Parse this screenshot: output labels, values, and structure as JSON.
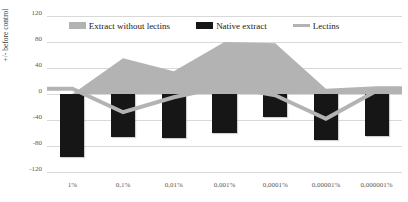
{
  "chart_data": {
    "type": "bar",
    "title": "",
    "xlabel": "",
    "ylabel": "+/- before control",
    "categories": [
      "1%",
      "0,1%",
      "0,01%",
      "0,001%",
      "0,0001%",
      "0,00001%",
      "0,000001%"
    ],
    "ylim": [
      -120,
      120
    ],
    "yticks": [
      120,
      80,
      40,
      0,
      -40,
      -80,
      -120
    ],
    "grid": true,
    "legend_position": "top",
    "series": [
      {
        "name": "Extract without lectins",
        "type": "area",
        "color": "#b3b3b3",
        "values": [
          0,
          55,
          35,
          80,
          78,
          8,
          12
        ]
      },
      {
        "name": "Native extract",
        "type": "bar",
        "color": "#161616",
        "values": [
          -97,
          -66,
          -68,
          -60,
          -35,
          -71,
          -65
        ]
      },
      {
        "name": "Lectins",
        "type": "line",
        "color": "#b3b3b3",
        "values": [
          8,
          -28,
          -5,
          12,
          -2,
          -38,
          5
        ]
      }
    ]
  },
  "axis": {
    "y_title": "+/- before control",
    "y_labels": [
      "120",
      "80",
      "40",
      "0",
      "-40",
      "-80",
      "-120"
    ],
    "x_labels": [
      "1%",
      "0,1%",
      "0,01%",
      "0,001%",
      "0,0001%",
      "0,00001%",
      "0,000001%"
    ]
  },
  "legend": {
    "items": [
      {
        "label": "Extract without lectins",
        "color": "#b3b3b3",
        "marker": "area-swatch"
      },
      {
        "label": "Native extract",
        "color": "#161616",
        "marker": "bar-swatch"
      },
      {
        "label": "Lectins",
        "color": "#b3b3b3",
        "marker": "line-swatch"
      }
    ]
  },
  "colors": {
    "area": "#b3b3b3",
    "bar": "#161616",
    "line": "#b3b3b3",
    "grid": "#d9d9d9",
    "text": "#5a5a5a",
    "background": "#ffffff"
  }
}
